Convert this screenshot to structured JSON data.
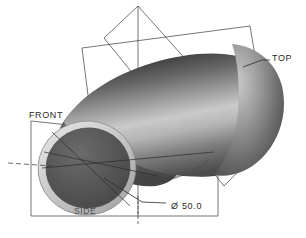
{
  "view": {
    "title": "Pipe Elbow Shaded Model View",
    "background_color": "#ffffff",
    "line_color": "#3a3a3a"
  },
  "datum_planes": [
    {
      "id": "top",
      "label": "TOP",
      "label_x": 272,
      "label_y": 61
    },
    {
      "id": "front",
      "label": "FRONT",
      "label_x": 29,
      "label_y": 118
    },
    {
      "id": "side",
      "label": "SIDE",
      "label_x": 74,
      "label_y": 214
    }
  ],
  "dimensions": [
    {
      "id": "bore-diameter",
      "symbol": "Ø",
      "value": "50.0",
      "text": "Ø 50.0",
      "label_x": 171,
      "label_y": 209
    }
  ],
  "model": {
    "name": "pipe-elbow",
    "shading": {
      "highlight_color": "#cfcfcf",
      "midtone_color": "#8e8e8e",
      "shadow_color": "#4a4a4a",
      "deep_shadow_color": "#3b3b3b"
    },
    "end_face": {
      "rim_color": "#d2d2d2",
      "bore_color": "#565656",
      "center_x": 87,
      "center_y": 168,
      "outer_rx": 49,
      "outer_ry": 47
    }
  },
  "annotations": {
    "leader_color": "#3a3a3a",
    "centerline_style": "dashed"
  }
}
